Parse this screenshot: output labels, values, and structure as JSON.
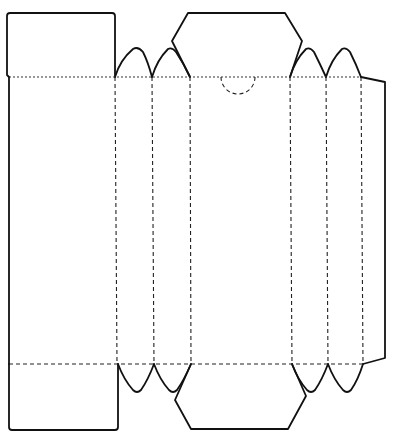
{
  "diagram": {
    "type": "box-dieline-net",
    "colors": {
      "background": "#ffffff",
      "cut_line": "#111111",
      "fold_line": "#222222"
    },
    "parts": [
      {
        "name": "top-left-flap",
        "shape": "rectangle"
      },
      {
        "name": "main-body-panel",
        "shape": "rectangle"
      },
      {
        "name": "side-panels",
        "count": 5
      },
      {
        "name": "top-arch-tabs",
        "count": 4
      },
      {
        "name": "bottom-arch-tabs",
        "count": 4
      },
      {
        "name": "top-hexagon-lid",
        "shape": "hexagon"
      },
      {
        "name": "bottom-hexagon-lid",
        "shape": "hexagon"
      },
      {
        "name": "thumb-notch",
        "shape": "semicircle"
      },
      {
        "name": "glue-tab",
        "shape": "trapezoid"
      },
      {
        "name": "bottom-left-flap",
        "shape": "rectangle"
      }
    ],
    "fold_lines": {
      "horizontal_y": [
        77,
        364
      ],
      "vertical_x": [
        115,
        152,
        190,
        290,
        326,
        361
      ]
    }
  }
}
